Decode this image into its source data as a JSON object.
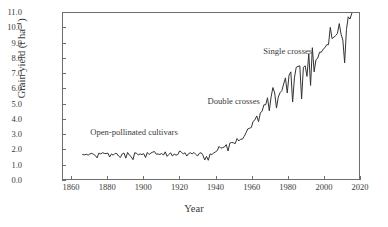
{
  "chart_data": {
    "type": "line",
    "title": "",
    "xlabel": "Year",
    "ylabel": "Grain yield (t ha⁻¹)",
    "ylabel_text": "Grain yield (t ha",
    "ylabel_sup": "−1",
    "ylabel_tail": ")",
    "xlim": [
      1855,
      2020
    ],
    "ylim": [
      0.0,
      11.0
    ],
    "grid": false,
    "legend": "none",
    "xticks": [
      1860,
      1880,
      1900,
      1920,
      1940,
      1960,
      1980,
      2000,
      2020
    ],
    "xticklabels": [
      "1860",
      "1880",
      "1900",
      "1920",
      "1940",
      "1960",
      "1980",
      "2000",
      "2020"
    ],
    "yticks": [
      0.0,
      1.0,
      2.0,
      3.0,
      4.0,
      5.0,
      6.0,
      7.0,
      8.0,
      9.0,
      10.0,
      11.0
    ],
    "yticklabels": [
      "0.0",
      "1.0",
      "2.0",
      "3.0",
      "4.0",
      "5.0",
      "6.0",
      "7.0",
      "8.0",
      "9.0",
      "10.0",
      "11.0"
    ],
    "line_color": "#333333",
    "line_width": 1,
    "annotations": [
      {
        "name": "open-pollinated",
        "text": "Open-pollinated cultivars",
        "x": 1895,
        "y": 3.05
      },
      {
        "name": "double-crosses",
        "text": "Double crosses",
        "x": 1950,
        "y": 5.1
      },
      {
        "name": "single-crosses",
        "text": "Single crosses",
        "x": 1980,
        "y": 8.4
      }
    ],
    "series": [
      {
        "name": "US maize grain yield",
        "x": [
          1866,
          1867,
          1868,
          1869,
          1870,
          1871,
          1872,
          1873,
          1874,
          1875,
          1876,
          1877,
          1878,
          1879,
          1880,
          1881,
          1882,
          1883,
          1884,
          1885,
          1886,
          1887,
          1888,
          1889,
          1890,
          1891,
          1892,
          1893,
          1894,
          1895,
          1896,
          1897,
          1898,
          1899,
          1900,
          1901,
          1902,
          1903,
          1904,
          1905,
          1906,
          1907,
          1908,
          1909,
          1910,
          1911,
          1912,
          1913,
          1914,
          1915,
          1916,
          1917,
          1918,
          1919,
          1920,
          1921,
          1922,
          1923,
          1924,
          1925,
          1926,
          1927,
          1928,
          1929,
          1930,
          1931,
          1932,
          1933,
          1934,
          1935,
          1936,
          1937,
          1938,
          1939,
          1940,
          1941,
          1942,
          1943,
          1944,
          1945,
          1946,
          1947,
          1948,
          1949,
          1950,
          1951,
          1952,
          1953,
          1954,
          1955,
          1956,
          1957,
          1958,
          1959,
          1960,
          1961,
          1962,
          1963,
          1964,
          1965,
          1966,
          1967,
          1968,
          1969,
          1970,
          1971,
          1972,
          1973,
          1974,
          1975,
          1976,
          1977,
          1978,
          1979,
          1980,
          1981,
          1982,
          1983,
          1984,
          1985,
          1986,
          1987,
          1988,
          1989,
          1990,
          1991,
          1992,
          1993,
          1994,
          1995,
          1996,
          1997,
          1998,
          1999,
          2000,
          2001,
          2002,
          2003,
          2004,
          2005,
          2006,
          2007,
          2008,
          2009,
          2010,
          2011,
          2012,
          2013,
          2014,
          2015,
          2016
        ],
        "y": [
          1.62,
          1.6,
          1.64,
          1.58,
          1.66,
          1.7,
          1.64,
          1.56,
          1.4,
          1.72,
          1.66,
          1.74,
          1.7,
          1.68,
          1.72,
          1.46,
          1.66,
          1.58,
          1.7,
          1.68,
          1.52,
          1.42,
          1.66,
          1.72,
          1.38,
          1.76,
          1.58,
          1.48,
          1.28,
          1.74,
          1.7,
          1.6,
          1.66,
          1.62,
          1.68,
          1.42,
          1.76,
          1.62,
          1.72,
          1.78,
          1.82,
          1.64,
          1.66,
          1.62,
          1.7,
          1.58,
          1.8,
          1.5,
          1.62,
          1.74,
          1.52,
          1.66,
          1.58,
          1.62,
          1.86,
          1.78,
          1.66,
          1.74,
          1.52,
          1.68,
          1.74,
          1.66,
          1.76,
          1.64,
          1.52,
          1.7,
          1.74,
          1.58,
          1.26,
          1.5,
          1.24,
          1.66,
          1.62,
          1.72,
          1.8,
          1.88,
          2.16,
          2.04,
          2.08,
          2.12,
          2.28,
          1.86,
          2.38,
          2.42,
          2.4,
          2.34,
          2.68,
          2.52,
          2.64,
          2.64,
          2.82,
          3.06,
          3.32,
          3.36,
          3.42,
          3.82,
          3.92,
          4.18,
          3.8,
          4.38,
          4.5,
          4.92,
          4.92,
          5.38,
          4.52,
          5.44,
          6.06,
          5.7,
          4.7,
          5.42,
          5.72,
          5.86,
          6.3,
          6.7,
          5.7,
          6.88,
          7.1,
          5.1,
          6.7,
          7.4,
          7.46,
          7.5,
          5.3,
          7.4,
          7.5,
          6.8,
          8.3,
          6.2,
          8.7,
          7.1,
          7.9,
          8.0,
          8.4,
          8.4,
          8.6,
          8.7,
          8.9,
          8.9,
          10.05,
          9.3,
          9.4,
          9.5,
          9.65,
          10.3,
          9.6,
          9.2,
          7.7,
          9.9,
          10.75,
          10.6,
          10.98
        ]
      }
    ]
  }
}
